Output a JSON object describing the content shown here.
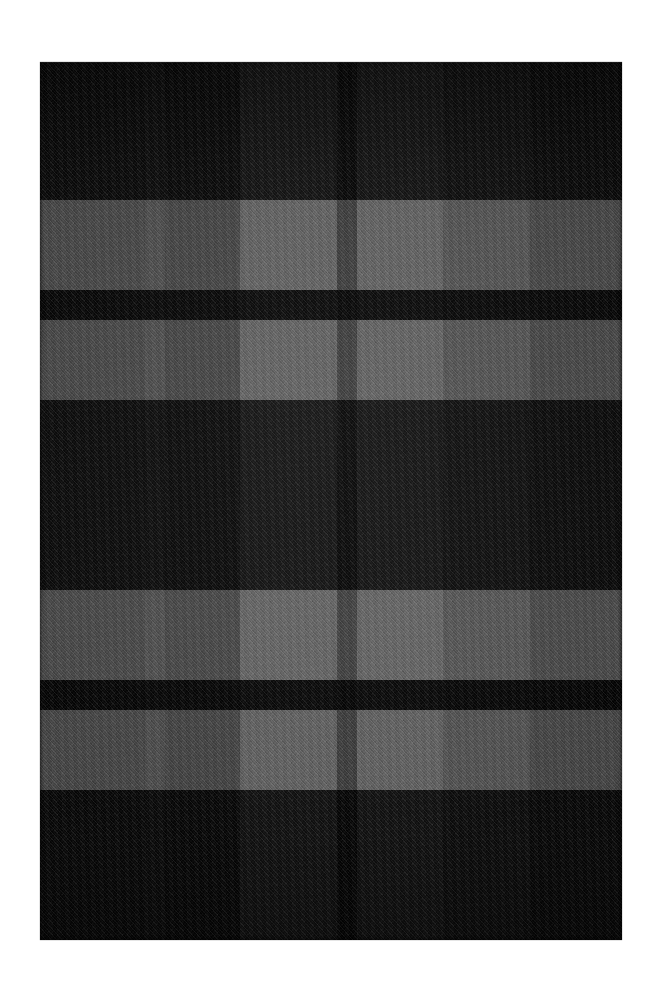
{
  "scene": {
    "subject": "plaid-wool-rug",
    "description": "Dark charcoal tartan / buffalo-check wool rug photographed flat on a white background",
    "background_color": "#ffffff",
    "canvas": {
      "width": 663,
      "height": 998
    }
  },
  "rug": {
    "name": "plaid-rug",
    "bounds": {
      "x": 40,
      "y": 62,
      "width": 582,
      "height": 878
    },
    "base_color": "#232323",
    "weave": "twill-diagonal",
    "palette": {
      "black": "#0b0b0b",
      "very_dark": "#141414",
      "dark": "#1d1d1d",
      "mid_dark": "#262626",
      "mid": "#2f2f2f",
      "light": "#3a3a3a",
      "lightest": "#424242"
    },
    "vertical_bands": [
      {
        "name": "warp-band-1",
        "x": 0,
        "width": 105,
        "color": "#161616"
      },
      {
        "name": "warp-band-2",
        "x": 105,
        "width": 20,
        "color": "#1f1f1f"
      },
      {
        "name": "warp-band-3",
        "x": 125,
        "width": 75,
        "color": "#141414"
      },
      {
        "name": "warp-band-4",
        "x": 200,
        "width": 97,
        "color": "#3a3a3a"
      },
      {
        "name": "warp-band-5",
        "x": 297,
        "width": 20,
        "color": "#0b0b0b"
      },
      {
        "name": "warp-band-6",
        "x": 317,
        "width": 86,
        "color": "#3a3a3a"
      },
      {
        "name": "warp-band-7",
        "x": 403,
        "width": 87,
        "color": "#272727"
      },
      {
        "name": "warp-band-8",
        "x": 490,
        "width": 92,
        "color": "#171717"
      }
    ],
    "horizontal_bands": [
      {
        "name": "weft-band-1",
        "y": 0,
        "height": 138,
        "tone": "dark",
        "color": "#0f0f0f"
      },
      {
        "name": "weft-band-2",
        "y": 138,
        "height": 90,
        "tone": "light",
        "color": "#333333"
      },
      {
        "name": "weft-band-3",
        "y": 228,
        "height": 30,
        "tone": "black",
        "color": "#060606"
      },
      {
        "name": "weft-band-4",
        "y": 258,
        "height": 80,
        "tone": "light",
        "color": "#333333"
      },
      {
        "name": "weft-band-5",
        "y": 338,
        "height": 190,
        "tone": "dark",
        "color": "#0f0f0f"
      },
      {
        "name": "weft-band-6",
        "y": 528,
        "height": 90,
        "tone": "light",
        "color": "#363636"
      },
      {
        "name": "weft-band-7",
        "y": 618,
        "height": 30,
        "tone": "black",
        "color": "#060606"
      },
      {
        "name": "weft-band-8",
        "y": 648,
        "height": 80,
        "tone": "light",
        "color": "#333333"
      },
      {
        "name": "weft-band-9",
        "y": 728,
        "height": 150,
        "tone": "dark",
        "color": "#0f0f0f"
      }
    ]
  }
}
